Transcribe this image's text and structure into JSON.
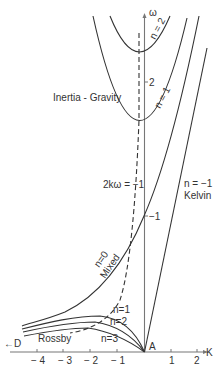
{
  "diagram": {
    "axes": {
      "x_label": "K",
      "y_label": "ω",
      "origin_label": "A",
      "arrow_left_label": "←D",
      "x_ticks": [
        "− 4",
        "− 3",
        "− 2",
        "− 1",
        "1",
        "2"
      ],
      "y_ticks": [
        "−1",
        "2"
      ]
    },
    "region_labels": {
      "inertia_gravity": "Inertia - Gravity",
      "rossby": "Rossby",
      "mixed": "Mixed",
      "kelvin": "Kelvin",
      "dashed_curve": "2kω = −1"
    },
    "curve_labels": {
      "ig_n2": "n = 2",
      "ig_n1": "n = 1",
      "mixed_n0": "n=0",
      "kelvin_n": "n = −1",
      "rossby_n1": "n=1",
      "rossby_n2": "n=2",
      "rossby_n3": "n=3"
    }
  }
}
